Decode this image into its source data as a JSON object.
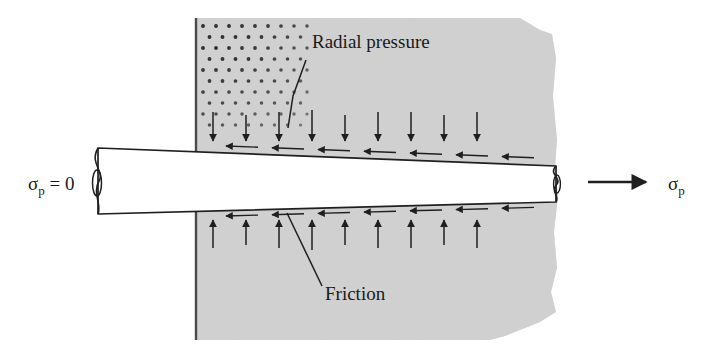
{
  "figure": {
    "background_color": "#ffffff",
    "width": 702,
    "height": 353
  },
  "colors": {
    "die_fill": "#d8d8d8",
    "die_edge": "#4a4a4a",
    "bar_fill": "#ffffff",
    "line": "#1f1f1f",
    "text": "#1a1a1a",
    "stipple_dot": "#2e2e2e"
  },
  "annotations": {
    "radial_pressure": {
      "label": "Radial pressure",
      "x": 312,
      "y": 48,
      "leader": "M 306 60 L 293 96 L 288 128"
    },
    "friction": {
      "label": "Friction",
      "x": 325,
      "y": 300,
      "leader": "M 322 286 L 287 213"
    }
  },
  "stress_labels": {
    "left": {
      "symbol": "σ",
      "subscript": "p",
      "suffix": " = 0",
      "x": 28,
      "y": 190
    },
    "right": {
      "symbol": "σ",
      "subscript": "p",
      "suffix": "",
      "x": 668,
      "y": 190,
      "arrow": "M 588 182 L 646 182"
    }
  },
  "die": {
    "name": "die-block",
    "left_edge_x": 196,
    "top_y": 18,
    "bottom_y": 340,
    "right_edge_x": 558,
    "outline": "M 196 18 L 520 18 L 540 30 L 552 34 L 556 58 L 553 96 L 557 140 L 555 168 L 558 196 L 554 232 L 557 268 L 551 292 L 556 312 L 540 322 L 520 330 L 505 336 L 490 340 L 196 340 Z"
  },
  "stipple": {
    "name": "stipple-pattern",
    "x": 203,
    "y": 26,
    "cols": 9,
    "rows": 10,
    "spacing_x": 13,
    "spacing_y": 11,
    "dot_radius": 1.6
  },
  "bar": {
    "name": "drawn-bar",
    "left_x": 98,
    "right_x": 556,
    "top_left_y": 148,
    "top_right_y": 166,
    "bottom_left_y": 214,
    "bottom_right_y": 202,
    "break_left": true,
    "break_right": true
  },
  "arrows": {
    "radial_top": {
      "name": "radial-pressure-arrows-top",
      "count": 9,
      "direction": "down",
      "start_x": 213,
      "spacing": 33,
      "tail_y": 112,
      "head_y": 141
    },
    "radial_bottom": {
      "name": "radial-pressure-arrows-bottom",
      "count": 9,
      "direction": "up",
      "start_x": 213,
      "spacing": 33,
      "tail_y": 248,
      "head_y": 220
    },
    "friction_top": {
      "name": "friction-arrows-top",
      "count": 7,
      "direction": "left",
      "start_x": 226,
      "spacing": 46,
      "length": 32,
      "y_start": 146,
      "y_slope": 0.038
    },
    "friction_bottom": {
      "name": "friction-arrows-bottom",
      "count": 7,
      "direction": "left",
      "start_x": 226,
      "spacing": 46,
      "length": 32,
      "y_start": 216,
      "y_slope": -0.028
    }
  },
  "chart_data": {
    "type": "diagram",
    "elements": [
      "die-block",
      "drawn-bar",
      "radial-pressure-arrows",
      "friction-arrows",
      "stress-labels"
    ],
    "labels": [
      "Radial pressure",
      "Friction",
      "σp = 0",
      "σp"
    ]
  }
}
